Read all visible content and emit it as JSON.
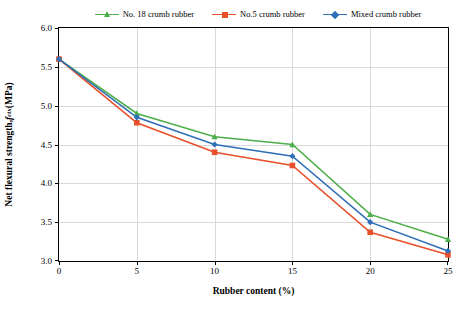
{
  "chart_data": {
    "type": "line",
    "title": "",
    "xlabel": "Rubber content (%)",
    "ylabel": "Net flexural strength, f_ctx (MPa)",
    "x": [
      0,
      5,
      10,
      15,
      20,
      25
    ],
    "xlim": [
      0,
      25
    ],
    "ylim": [
      3.0,
      6.0
    ],
    "xticks": [
      "0",
      "5",
      "10",
      "15",
      "20",
      "25"
    ],
    "yticks": [
      "3.0",
      "3.5",
      "4.0",
      "4.5",
      "5.0",
      "5.5",
      "6.0"
    ],
    "grid": true,
    "legend_position": "top",
    "series": [
      {
        "name": "No. 18 crumb rubber",
        "color": "#4daf4a",
        "marker": "triangle",
        "values": [
          5.6,
          4.9,
          4.6,
          4.5,
          3.6,
          3.28
        ]
      },
      {
        "name": "No.5 crumb rubber",
        "color": "#e8502a",
        "marker": "square",
        "values": [
          5.6,
          4.78,
          4.4,
          4.23,
          3.37,
          3.08
        ]
      },
      {
        "name": "Mixed crumb rubber",
        "color": "#2e6fb7",
        "marker": "diamond",
        "values": [
          5.6,
          4.85,
          4.5,
          4.35,
          3.5,
          3.13
        ]
      }
    ]
  },
  "axis": {
    "x_title": "Rubber content (%)",
    "y_title_pre": "Net flexural strength, ",
    "y_title_ital": "f",
    "y_title_sub": "ctx",
    "y_title_post": " (MPa)"
  },
  "legend": {
    "items": [
      {
        "label": "No. 18 crumb rubber"
      },
      {
        "label": "No.5 crumb rubber"
      },
      {
        "label": "Mixed crumb rubber"
      }
    ]
  }
}
